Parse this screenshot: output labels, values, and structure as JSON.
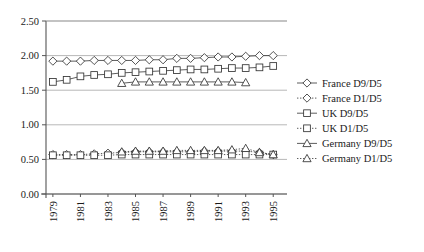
{
  "chart_data": {
    "type": "line",
    "title": "",
    "xlabel": "",
    "ylabel": "",
    "xlim": [
      1978.5,
      1996.0
    ],
    "ylim": [
      0.0,
      2.5
    ],
    "yticks": [
      "0.00",
      "0.50",
      "1.00",
      "1.50",
      "2.00",
      "2.50"
    ],
    "ytick_values": [
      0.0,
      0.5,
      1.0,
      1.5,
      2.0,
      2.5
    ],
    "xticks": [
      "1979",
      "1981",
      "1983",
      "1985",
      "1987",
      "1989",
      "1991",
      "1993",
      "1995"
    ],
    "xtick_values": [
      1979,
      1981,
      1983,
      1985,
      1987,
      1989,
      1991,
      1993,
      1995
    ],
    "xtick_rotation": -90,
    "grid": "horizontal",
    "legend_position": "right",
    "x": [
      1979,
      1980,
      1981,
      1982,
      1983,
      1984,
      1985,
      1986,
      1987,
      1988,
      1989,
      1990,
      1991,
      1992,
      1993,
      1994,
      1995
    ],
    "series": [
      {
        "name": "France D9/D5",
        "marker": "diamond",
        "line": "solid",
        "color": "#333333",
        "x": [
          1979,
          1980,
          1981,
          1982,
          1983,
          1984,
          1985,
          1986,
          1987,
          1988,
          1989,
          1990,
          1991,
          1992,
          1993,
          1994,
          1995
        ],
        "values": [
          1.92,
          1.92,
          1.92,
          1.93,
          1.93,
          1.93,
          1.93,
          1.94,
          1.94,
          1.96,
          1.96,
          1.97,
          1.98,
          1.98,
          1.99,
          2.0,
          2.0
        ]
      },
      {
        "name": "France D1/D5",
        "marker": "diamond",
        "line": "dotted",
        "color": "#333333",
        "x": [
          1979,
          1980,
          1981,
          1982,
          1983,
          1984,
          1985,
          1986,
          1987,
          1988,
          1989,
          1990,
          1991,
          1992,
          1993,
          1994,
          1995
        ],
        "values": [
          0.57,
          0.57,
          0.57,
          0.58,
          0.59,
          0.6,
          0.61,
          0.61,
          0.61,
          0.61,
          0.61,
          0.62,
          0.62,
          0.62,
          0.62,
          0.6,
          0.57
        ]
      },
      {
        "name": "UK D9/D5",
        "marker": "square",
        "line": "solid",
        "color": "#333333",
        "x": [
          1979,
          1980,
          1981,
          1982,
          1983,
          1984,
          1985,
          1986,
          1987,
          1988,
          1989,
          1990,
          1991,
          1992,
          1993,
          1994,
          1995
        ],
        "values": [
          1.62,
          1.65,
          1.7,
          1.72,
          1.73,
          1.75,
          1.76,
          1.77,
          1.78,
          1.79,
          1.8,
          1.8,
          1.81,
          1.82,
          1.82,
          1.83,
          1.85
        ]
      },
      {
        "name": "UK D1/D5",
        "marker": "square",
        "line": "dotted",
        "color": "#333333",
        "x": [
          1979,
          1980,
          1981,
          1982,
          1983,
          1984,
          1985,
          1986,
          1987,
          1988,
          1989,
          1990,
          1991,
          1992,
          1993,
          1994,
          1995
        ],
        "values": [
          0.56,
          0.56,
          0.56,
          0.56,
          0.56,
          0.57,
          0.57,
          0.57,
          0.57,
          0.57,
          0.57,
          0.57,
          0.57,
          0.57,
          0.57,
          0.57,
          0.57
        ]
      },
      {
        "name": "Germany D9/D5",
        "marker": "triangle",
        "line": "solid",
        "color": "#333333",
        "x": [
          1984,
          1985,
          1986,
          1987,
          1988,
          1989,
          1990,
          1991,
          1992,
          1993
        ],
        "values": [
          1.6,
          1.62,
          1.62,
          1.62,
          1.62,
          1.62,
          1.62,
          1.62,
          1.62,
          1.61
        ]
      },
      {
        "name": "Germany D1/D5",
        "marker": "triangle",
        "line": "dotted",
        "color": "#333333",
        "x": [
          1984,
          1985,
          1986,
          1987,
          1988,
          1989,
          1990,
          1991,
          1992,
          1993,
          1994,
          1995
        ],
        "values": [
          0.61,
          0.62,
          0.62,
          0.62,
          0.63,
          0.63,
          0.63,
          0.63,
          0.64,
          0.66,
          0.6,
          0.57
        ]
      }
    ]
  },
  "legend": {
    "items": [
      {
        "label": "France D9/D5",
        "marker": "diamond",
        "line": "solid"
      },
      {
        "label": "France D1/D5",
        "marker": "diamond",
        "line": "dotted"
      },
      {
        "label": "UK D9/D5",
        "marker": "square",
        "line": "solid"
      },
      {
        "label": "UK D1/D5",
        "marker": "square",
        "line": "dotted"
      },
      {
        "label": "Germany D9/D5",
        "marker": "triangle",
        "line": "solid"
      },
      {
        "label": "Germany D1/D5",
        "marker": "triangle",
        "line": "dotted"
      }
    ]
  },
  "colors": {
    "axis": "#555555",
    "grid": "#999999",
    "plot_background": "#ffffff",
    "series": "#333333",
    "text": "#1a1a1a"
  }
}
